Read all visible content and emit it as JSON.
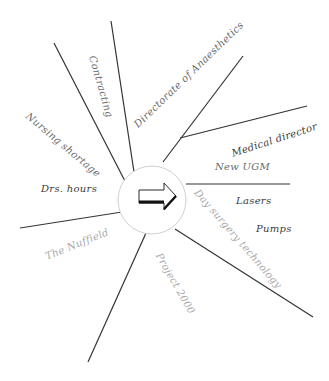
{
  "diagram": {
    "type": "spider-diagram",
    "center": {
      "icon": "right-arrow-icon",
      "cx": 152,
      "cy": 200,
      "r": 34,
      "circle_stroke": "#cfcfcf"
    },
    "line_color": "#333333",
    "spokes": [
      {
        "id": "contracting-left",
        "x1": 128,
        "y1": 187,
        "x2": 54,
        "y2": 43
      },
      {
        "id": "contracting-right",
        "x1": 134,
        "y1": 172,
        "x2": 111,
        "y2": 21
      },
      {
        "id": "directorate",
        "x1": 163,
        "y1": 162,
        "x2": 243,
        "y2": 56
      },
      {
        "id": "medical-director",
        "x1": 180,
        "y1": 138,
        "x2": 307,
        "y2": 106
      },
      {
        "id": "new-ugm",
        "x1": 186,
        "y1": 184,
        "x2": 290,
        "y2": 184
      },
      {
        "id": "day-surgery",
        "x1": 175,
        "y1": 229,
        "x2": 313,
        "y2": 317
      },
      {
        "id": "project-2000",
        "x1": 146,
        "y1": 233,
        "x2": 88,
        "y2": 362
      },
      {
        "id": "nuffield",
        "x1": 122,
        "y1": 212,
        "x2": 20,
        "y2": 228
      }
    ],
    "labels": [
      {
        "text": "Contracting",
        "x": 92,
        "y": 56,
        "rotate": 74,
        "tone": "mid"
      },
      {
        "text": "Directorate of Anaesthetics",
        "x": 136,
        "y": 126,
        "rotate": -44,
        "tone": "mid"
      },
      {
        "text": "Nursing shortage",
        "x": 27,
        "y": 115,
        "rotate": 40,
        "tone": "mid"
      },
      {
        "text": "Drs. hours",
        "x": 41,
        "y": 189,
        "rotate": 0,
        "tone": "dark"
      },
      {
        "text": "Medical director",
        "x": 232,
        "y": 154,
        "rotate": -18,
        "tone": "dark"
      },
      {
        "text": "New UGM",
        "x": 215,
        "y": 167,
        "rotate": 0,
        "tone": "mid"
      },
      {
        "text": "Lasers",
        "x": 236,
        "y": 201,
        "rotate": 0,
        "tone": "dark"
      },
      {
        "text": "Pumps",
        "x": 256,
        "y": 229,
        "rotate": 0,
        "tone": "dark"
      },
      {
        "text": "Day surgery technology",
        "x": 196,
        "y": 191,
        "rotate": 49,
        "tone": "light"
      },
      {
        "text": "Project 2000",
        "x": 158,
        "y": 254,
        "rotate": 60,
        "tone": "light"
      },
      {
        "text": "The Nuffield",
        "x": 46,
        "y": 257,
        "rotate": -22,
        "tone": "light"
      }
    ]
  }
}
